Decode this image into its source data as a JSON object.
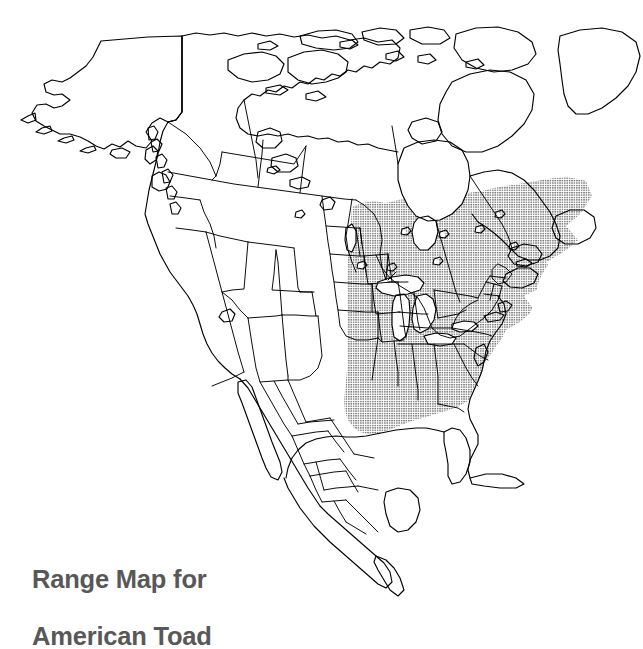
{
  "figure": {
    "kind": "species-range-map",
    "background_color": "#ffffff",
    "width": 643,
    "height": 631
  },
  "caption": {
    "line1": "Range Map for",
    "line2": "American Toad",
    "full_text": "Range Map for American Toad",
    "color": "#585858"
  },
  "map": {
    "region": "North America",
    "outline_color": "#000000",
    "fill_color": "#ffffff",
    "water_color": "#ffffff",
    "stroke_width": 1.1,
    "landmasses": [
      "Alaska",
      "Canada",
      "United States",
      "Mexico",
      "Greenland (partial)",
      "Arctic Archipelago",
      "Newfoundland",
      "Cuba (partial)"
    ],
    "internal_boundaries": [
      "US state lines",
      "Canadian province lines",
      "Mexican state lines"
    ],
    "water_bodies": [
      "Hudson Bay",
      "James Bay",
      "Lake Superior",
      "Lake Michigan",
      "Lake Huron",
      "Lake Erie",
      "Lake Ontario",
      "Great Bear Lake",
      "Great Slave Lake",
      "Lake Winnipeg",
      "Great Salt Lake",
      "Gulf of Mexico",
      "Gulf of California"
    ]
  },
  "range_overlay": {
    "label": "American Toad distribution",
    "pattern": "stipple-halftone-dots",
    "dot_color": "#1a1a1a",
    "dot_spacing_px": 2.4,
    "apparent_gray": "#8a8a8a",
    "coverage_description": "Eastern and northeastern North America: from the eastern Dakotas, eastern Kansas and eastern Oklahoma east to the Atlantic coast; north through Manitoba, Ontario, Quebec, Labrador and Newfoundland; south to Louisiana, Mississippi, Alabama and Georgia, excluding Florida and the southern coastal plain.",
    "excluded_areas": [
      "Great Lakes",
      "Hudson Bay",
      "Florida",
      "Atlantic coastal plain",
      "Western United States",
      "Western Canada",
      "Mexico"
    ]
  },
  "legend": {
    "present": false
  }
}
